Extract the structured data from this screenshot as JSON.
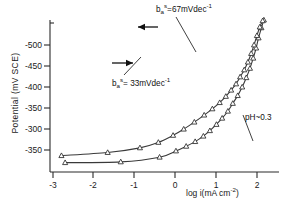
{
  "chart_data": {
    "type": "line",
    "title": "",
    "xlabel": "log i(mA cm⁻²)",
    "ylabel": "Potential (mV SCE)",
    "xlim": [
      -3.25,
      2.35
    ],
    "ylim": [
      -525,
      -330
    ],
    "xticks": [
      -3,
      -2,
      -1,
      0,
      1,
      2
    ],
    "xtick_labels": [
      "-3",
      "-2",
      "-1",
      "0",
      "1",
      "2"
    ],
    "yticks": [
      -500,
      -450,
      -400,
      -350,
      -300,
      -250
    ],
    "ytick_labels": [
      "-500",
      "-450",
      "-400",
      "-350",
      "-300",
      "-350"
    ],
    "grid": false,
    "legend": "none",
    "series": [
      {
        "name": "b_a^s = 67 mVdec^-1 (upper branch, reverse scan)",
        "tafel_slope_mV_per_decade": 67,
        "direction": "reverse",
        "points": [
          {
            "x": -2.88,
            "y": -513
          },
          {
            "x": -1.52,
            "y": -512
          },
          {
            "x": -0.57,
            "y": -506
          },
          {
            "x": -0.17,
            "y": -498
          },
          {
            "x": 0.08,
            "y": -492
          },
          {
            "x": 0.3,
            "y": -486
          },
          {
            "x": 0.5,
            "y": -479
          },
          {
            "x": 0.66,
            "y": -472
          },
          {
            "x": 0.82,
            "y": -464
          },
          {
            "x": 0.96,
            "y": -456
          },
          {
            "x": 1.1,
            "y": -447
          },
          {
            "x": 1.22,
            "y": -437
          },
          {
            "x": 1.34,
            "y": -427
          },
          {
            "x": 1.45,
            "y": -416
          },
          {
            "x": 1.55,
            "y": -404
          },
          {
            "x": 1.64,
            "y": -392
          },
          {
            "x": 1.72,
            "y": -379
          },
          {
            "x": 1.79,
            "y": -366
          },
          {
            "x": 1.85,
            "y": -353
          },
          {
            "x": 1.92,
            "y": -340
          },
          {
            "x": 1.98,
            "y": -330
          }
        ]
      },
      {
        "name": "b_a^s = 33 mVdec^-1 (lower branch, forward scan)",
        "tafel_slope_mV_per_decade": 33,
        "direction": "forward",
        "points": [
          {
            "x": -2.97,
            "y": -504
          },
          {
            "x": -1.84,
            "y": -500
          },
          {
            "x": -1.05,
            "y": -494
          },
          {
            "x": -0.6,
            "y": -487
          },
          {
            "x": -0.24,
            "y": -478
          },
          {
            "x": 0.02,
            "y": -470
          },
          {
            "x": 0.28,
            "y": -461
          },
          {
            "x": 0.52,
            "y": -452
          },
          {
            "x": 0.72,
            "y": -444
          },
          {
            "x": 0.9,
            "y": -436
          },
          {
            "x": 1.05,
            "y": -428
          },
          {
            "x": 1.18,
            "y": -420
          },
          {
            "x": 1.3,
            "y": -412
          },
          {
            "x": 1.4,
            "y": -403
          },
          {
            "x": 1.5,
            "y": -394
          },
          {
            "x": 1.59,
            "y": -384
          },
          {
            "x": 1.67,
            "y": -373
          },
          {
            "x": 1.74,
            "y": -362
          },
          {
            "x": 1.81,
            "y": -350
          },
          {
            "x": 1.88,
            "y": -339
          },
          {
            "x": 1.95,
            "y": -331
          }
        ]
      }
    ],
    "annotations": [
      {
        "id": "annot-top",
        "text": "b_a^s = 67 mVdec^-1",
        "base": "b",
        "sub": "a",
        "sup": "s",
        "value": "=67mVdec",
        "exp": "-1"
      },
      {
        "id": "annot-bottom",
        "text": "b_a^s = 33 mVdec^-1",
        "base": "b",
        "sub": "a",
        "sup": "s",
        "value": "= 33mVdec",
        "exp": "-1"
      },
      {
        "id": "annot-ph",
        "text": "pH~0.3"
      }
    ],
    "arrows": [
      {
        "id": "arrow-upper",
        "direction": "left",
        "meaning": "reverse scan direction"
      },
      {
        "id": "arrow-lower",
        "direction": "right",
        "meaning": "forward scan direction"
      }
    ]
  },
  "labels": {
    "ylabel": "Potential (mV SCE)",
    "xlabel_main": "log i(mA cm",
    "xlabel_exp": "-2",
    "xlabel_close": ")",
    "ph": "pH~0.3",
    "annot_top_base": "b",
    "annot_top_sub": "a",
    "annot_top_sup": "s",
    "annot_top_rest": "=67mVdec",
    "annot_top_exp": "-1",
    "annot_bottom_base": "b",
    "annot_bottom_sub": "a",
    "annot_bottom_sup": "s",
    "annot_bottom_rest": "= 33mVdec",
    "annot_bottom_exp": "-1"
  },
  "colors": {
    "axis": "#2b2b2b",
    "curve": "#3a3a3a",
    "marker_fill": "#ffffff",
    "text": "#1a1a1a",
    "background": "#ffffff"
  }
}
